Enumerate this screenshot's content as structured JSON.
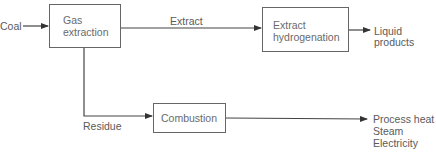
{
  "diagram": {
    "input": "Coal",
    "nodes": {
      "gas_extraction": {
        "line1": "Gas",
        "line2": "extraction"
      },
      "extract_hydrogenation": {
        "line1": "Extract",
        "line2": "hydrogenation"
      },
      "combustion": {
        "label": "Combustion"
      }
    },
    "edges": {
      "extract": "Extract",
      "residue": "Residue"
    },
    "outputs": {
      "liquid": {
        "line1": "Liquid",
        "line2": "products"
      },
      "combustion_outputs": [
        "Process heat",
        "Steam",
        "Electricity"
      ]
    },
    "colors": {
      "line": "#444444",
      "text": "#5a5a5a",
      "background": "#ffffff"
    }
  }
}
